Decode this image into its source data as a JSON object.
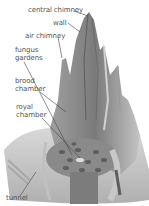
{
  "diagram": {
    "labels": [
      {
        "id": "central-chimney",
        "text": "central chimney"
      },
      {
        "id": "wall",
        "text": "wall"
      },
      {
        "id": "air-chimney",
        "text": "air chimney"
      },
      {
        "id": "fungus-gardens",
        "text": "fungus gardens",
        "lines": [
          "fungus",
          "gardens"
        ]
      },
      {
        "id": "brood-chamber",
        "text": "brood chamber",
        "lines": [
          "brood",
          "chamber"
        ]
      },
      {
        "id": "royal-chamber",
        "text": "royal chamber",
        "lines": [
          "royal",
          "chamber"
        ]
      },
      {
        "id": "tunnel",
        "text": "tunnel"
      }
    ],
    "colors": {
      "background": "#ffffff",
      "mound_light": "#b8b8b8",
      "mound_mid": "#8e8e8e",
      "mound_dark": "#5e5e5e",
      "label": "#555555",
      "leader": "#444444"
    }
  }
}
